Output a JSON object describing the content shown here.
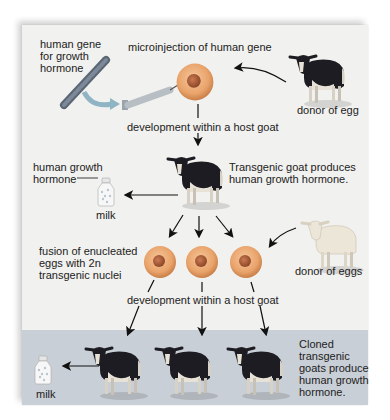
{
  "diagram": {
    "colors": {
      "panel": "#f1f1ef",
      "band": "#c9cfd6",
      "egg": "#e9a36b",
      "egg_nucleus": "#b5603a",
      "goat_dark": "#1c1c22",
      "goat_light": "#e8e2d6",
      "donor_eggs_goat": "#ece6d8",
      "chromosome": "#6f7c8c",
      "arrow": "#111111"
    },
    "labels": {
      "human_gene": "human gene\nfor growth\nhormone",
      "microinjection": "microinjection of human gene",
      "donor_of_egg": "donor of egg",
      "development_1": "development within a host goat",
      "human_growth_hormone": "human growth\nhormone",
      "milk_1": "milk",
      "transgenic_goat": "Transgenic goat produces\nhuman growth hormone.",
      "fusion": "fusion of enucleated\neggs with 2n\ntransgenic nuclei",
      "donor_of_eggs": "donor of eggs",
      "development_2": "development within a host goat",
      "milk_2": "milk",
      "cloned_goats": "Cloned\ntransgenic\ngoats produce\nhuman growth\nhormone."
    },
    "nodes": [
      {
        "id": "chromosome",
        "icon": "chromosome-icon"
      },
      {
        "id": "syringe",
        "icon": "syringe-icon"
      },
      {
        "id": "egg_injected",
        "icon": "egg-cell-icon"
      },
      {
        "id": "donor_goat",
        "icon": "goat-icon"
      },
      {
        "id": "transgenic_goat",
        "icon": "goat-icon"
      },
      {
        "id": "milk_bottle_1",
        "icon": "milk-bottle-icon"
      },
      {
        "id": "eggs_fused",
        "icon": "egg-cell-icon",
        "count": 3
      },
      {
        "id": "donor_eggs_goat",
        "icon": "goat-icon"
      },
      {
        "id": "cloned_goats",
        "icon": "goat-icon",
        "count": 3
      },
      {
        "id": "milk_bottle_2",
        "icon": "milk-bottle-icon"
      }
    ]
  }
}
